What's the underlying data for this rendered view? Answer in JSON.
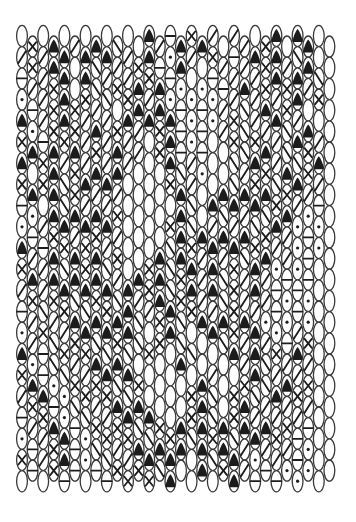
{
  "diagram": {
    "type": "tablet-weaving-pattern",
    "ghost_title": "",
    "grid": {
      "columns": 30,
      "rows": 22,
      "origin_x": 22,
      "origin_y": 36,
      "col_pitch": 10.6,
      "row_pitch": 21.2,
      "cell_rx": 5.4,
      "cell_ry": 10.6,
      "stagger": 10.6
    },
    "colors": {
      "ink": "#1c1c1c",
      "outline": "#3a3a3a",
      "paper": "#ffffff"
    },
    "legend_symbols": {
      ".": "blank",
      "o": "dot",
      "-": "dash",
      "/": "slash",
      "\\": "backslash",
      "x": "cross",
      "A": "filled-triangle"
    },
    "rows": [
      ".x.A./.A.\\..A/-AxA/.//.xA.AA.",
      "/x/AA.A\\A//xA-oA/.x/-/AxA/\\A.",
      "-//xA.A\\/x/AxA-o.o--/A/xAxA/\\",
      "o-/xAxx/\\.xA/Ao-o-o//\\/A/xA.x",
      "Ao/xAx/A/xA/AxA-o-o/x\\//A\\/A.",
      "xA-AxA/x/A//.xA-o-..x\\xA/\\Ax/",
      "A.xA/x/A/A/...A\\/o..\\/Ax/A\\xA",
      "xAxA\\xA/A/....xA/..A\\AxA\\xA//",
      "-o.A\\A/A/x.....A\\.A\\A/A\\xA/o-",
      "o-/xA/AxA/....xA\\A/A/A\\xA/o-o",
      "A/-AxAxA/x...A\\Ax/A/A\\xA//o-o",
      "xA/A\\AxA\\/.AxA\\xA/A\\x/A/o-o-",
      "/x/xA\\AxA\\A/xA\\xA/A\\x/A/-o-o",
      "-/\\/xA\\AxAA\\/xA\\xA/AxA/o-o-o",
      "o/x\\/xA\\AxA\\.xA\\..A\\x/A/o-/x",
      "Ao-\\x/xA\\A\\.x..A\\...A/A\\x/A/",
      "xA-o\\x/xA\\Ax.....A/..xA\\/A/x",
      "/xA-o\\x/xA\\A....xA\\.xA\\/A/x/",
      "-/xAo-\\x/xA\\Ax.AxA\\AxA/A/x/-",
      "o-/xA-o\\x/xA\\AxA\\AxA\\/A/x/-o",
      "x-/xA-o-\\x/xA\\A..A\\xA/o-/o-o",
      ".A./-o.o-\\x/xAA.....A/-o-/o-."
    ]
  }
}
